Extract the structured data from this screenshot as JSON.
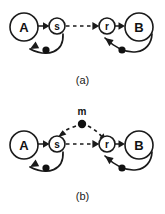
{
  "figure": {
    "background_color": "#ffffff",
    "ink_color": "#1a1a1a",
    "width": 165,
    "height": 214
  },
  "panels": [
    {
      "id": "a",
      "caption": "(a)",
      "nodes": [
        {
          "id": "A",
          "label": "A",
          "type": "population",
          "shape": "circle",
          "size": "large",
          "cx": 24,
          "cy": 27,
          "r": 14
        },
        {
          "id": "s",
          "label": "s",
          "type": "unit",
          "shape": "circle",
          "size": "small",
          "cx": 57,
          "cy": 26,
          "r": 8
        },
        {
          "id": "r",
          "label": "r",
          "type": "unit",
          "shape": "circle",
          "size": "small",
          "cx": 107,
          "cy": 26,
          "r": 8
        },
        {
          "id": "B",
          "label": "B",
          "type": "population",
          "shape": "circle",
          "size": "large",
          "cx": 139,
          "cy": 27,
          "r": 14
        }
      ],
      "dots": [
        {
          "id": "dot-sa",
          "cx": 46,
          "cy": 50,
          "r": 3.6
        },
        {
          "id": "dot-br",
          "cx": 122,
          "cy": 50,
          "r": 3.6
        }
      ],
      "edges": [
        {
          "id": "A-to-s",
          "from": "A",
          "to": "s",
          "style": "solid",
          "arrow": true
        },
        {
          "id": "s-to-r",
          "from": "s",
          "to": "r",
          "style": "dashed",
          "arrow": true
        },
        {
          "id": "r-to-B",
          "from": "r",
          "to": "B",
          "style": "solid",
          "arrow": true
        },
        {
          "id": "s-to-A",
          "from": "s",
          "to": "A",
          "style": "solid",
          "arrow": true,
          "curved": true,
          "has_dot": true
        },
        {
          "id": "B-to-r",
          "from": "B",
          "to": "r",
          "style": "solid",
          "arrow": true,
          "curved": true,
          "has_dot": true
        }
      ]
    },
    {
      "id": "b",
      "caption": "(b)",
      "nodes": [
        {
          "id": "A",
          "label": "A",
          "type": "population",
          "shape": "circle",
          "size": "large",
          "cx": 24,
          "cy": 45,
          "r": 14
        },
        {
          "id": "s",
          "label": "s",
          "type": "unit",
          "shape": "circle",
          "size": "small",
          "cx": 57,
          "cy": 44,
          "r": 8
        },
        {
          "id": "r",
          "label": "r",
          "type": "unit",
          "shape": "circle",
          "size": "small",
          "cx": 107,
          "cy": 44,
          "r": 8
        },
        {
          "id": "B",
          "label": "B",
          "type": "population",
          "shape": "circle",
          "size": "large",
          "cx": 139,
          "cy": 45,
          "r": 14
        },
        {
          "id": "m",
          "label": "m",
          "type": "modulator",
          "shape": "dot",
          "cx": 82,
          "cy": 24,
          "r": 4.2
        }
      ],
      "dots": [
        {
          "id": "dot-sa",
          "cx": 46,
          "cy": 68,
          "r": 3.6
        },
        {
          "id": "dot-br",
          "cx": 122,
          "cy": 68,
          "r": 3.6
        }
      ],
      "edges": [
        {
          "id": "A-to-s",
          "from": "A",
          "to": "s",
          "style": "solid",
          "arrow": true
        },
        {
          "id": "s-to-r",
          "from": "s",
          "to": "r",
          "style": "dashed",
          "arrow": true
        },
        {
          "id": "r-to-B",
          "from": "r",
          "to": "B",
          "style": "solid",
          "arrow": true
        },
        {
          "id": "s-to-A",
          "from": "s",
          "to": "A",
          "style": "solid",
          "arrow": true,
          "curved": true,
          "has_dot": true
        },
        {
          "id": "B-to-r",
          "from": "B",
          "to": "r",
          "style": "solid",
          "arrow": true,
          "curved": true,
          "has_dot": true
        },
        {
          "id": "m-to-s",
          "from": "m",
          "to": "s",
          "style": "dashed",
          "arrow": true
        },
        {
          "id": "m-to-r",
          "from": "m",
          "to": "r",
          "style": "dashed",
          "arrow": true
        }
      ]
    }
  ]
}
